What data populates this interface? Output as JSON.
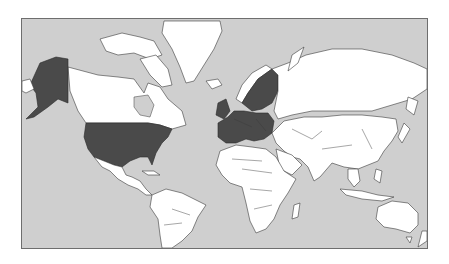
{
  "map": {
    "projection": "mercator",
    "colors": {
      "ocean": "#cfcfcf",
      "land": "#ffffff",
      "highlighted": "#4a4a4a",
      "border": "#3a3a3a",
      "frame": "#6e6e6e"
    },
    "highlighted_regions": [
      "United States (incl. Alaska)",
      "European Union member states"
    ]
  }
}
